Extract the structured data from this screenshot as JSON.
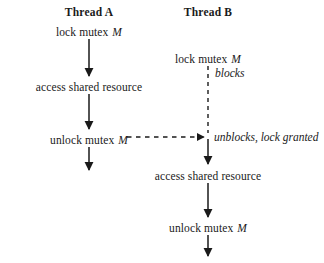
{
  "diagram": {
    "width": 324,
    "height": 263,
    "background": "#ffffff",
    "ink": "#1a1a1a"
  },
  "columns": {
    "thread_a": {
      "header": "Thread A",
      "center_x": 89,
      "steps": [
        {
          "text": "lock mutex ",
          "var": "M",
          "y": 32
        },
        {
          "text": "access shared resource",
          "var": "",
          "y": 87
        },
        {
          "text": "unlock mutex ",
          "var": "M",
          "y": 140
        }
      ]
    },
    "thread_b": {
      "header": "Thread B",
      "center_x": 208,
      "steps": [
        {
          "text": "lock mutex ",
          "var": "M",
          "y": 59
        },
        {
          "text": "access shared resource",
          "var": "",
          "y": 176
        },
        {
          "text": "unlock mutex ",
          "var": "M",
          "y": 228
        }
      ]
    }
  },
  "annotations": {
    "blocks": "blocks",
    "unblocks": "unblocks, lock granted"
  },
  "arrows": {
    "a_down_1": {
      "x": 89,
      "y1": 38,
      "y2": 78,
      "style": "solid"
    },
    "a_down_2": {
      "x": 89,
      "y1": 93,
      "y2": 131,
      "style": "solid"
    },
    "a_down_3": {
      "x": 89,
      "y1": 146,
      "y2": 172,
      "style": "solid"
    },
    "b_blocked": {
      "x": 208,
      "y1": 65,
      "y2": 133,
      "style": "dashed"
    },
    "b_down_1": {
      "x": 208,
      "y1": 140,
      "y2": 166,
      "style": "solid"
    },
    "b_down_2": {
      "x": 208,
      "y1": 182,
      "y2": 219,
      "style": "solid"
    },
    "b_down_3": {
      "x": 208,
      "y1": 234,
      "y2": 258,
      "style": "solid"
    },
    "signal": {
      "x1": 126,
      "x2": 205,
      "y": 137,
      "style": "dashed-horizontal"
    }
  },
  "headers": {
    "thread_a_y": 6,
    "thread_b_y": 6
  }
}
